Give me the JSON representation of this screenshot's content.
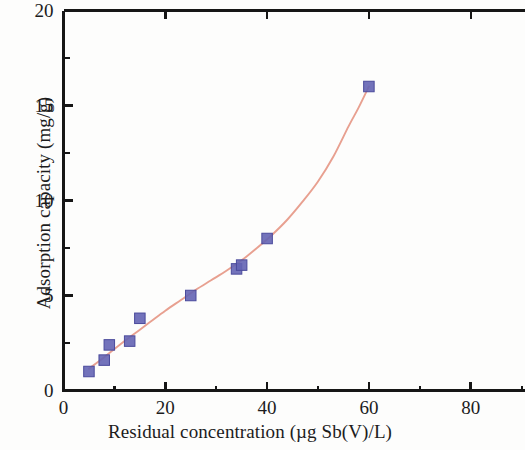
{
  "chart_data": {
    "type": "scatter",
    "title": "",
    "xlabel": "Residual concentration (µg Sb(V)/L)",
    "ylabel": "Adsorption capacity (mg/g)",
    "xlim": [
      0,
      90
    ],
    "ylim": [
      0,
      20
    ],
    "xticks": [
      0,
      20,
      40,
      60,
      80
    ],
    "xtick_labels": [
      "0",
      "20",
      "40",
      "60",
      "80"
    ],
    "x_minor_ticks": [
      10,
      30,
      50,
      70,
      90
    ],
    "yticks": [
      0,
      5,
      10,
      15,
      20
    ],
    "ytick_labels": [
      "0",
      "5",
      "10",
      "15",
      "20"
    ],
    "y_minor_ticks": [
      2.5,
      7.5,
      12.5,
      17.5
    ],
    "grid": false,
    "legend": false,
    "series": [
      {
        "name": "Adsorption isotherm data",
        "marker": "square",
        "marker_color": "#6464b4",
        "x": [
          5,
          8,
          9,
          13,
          15,
          25,
          34,
          35,
          40,
          60
        ],
        "y": [
          1.0,
          1.6,
          2.4,
          2.6,
          3.8,
          5.0,
          6.4,
          6.6,
          8.0,
          16.0
        ]
      },
      {
        "name": "Fitted isotherm curve",
        "type": "line",
        "line_color": "#e8a090",
        "x": [
          5,
          8,
          11,
          14,
          17,
          20,
          23,
          26,
          29,
          32,
          35,
          38,
          41,
          44,
          47,
          50,
          53,
          56,
          58,
          60
        ],
        "y": [
          1.15,
          1.75,
          2.4,
          3.0,
          3.6,
          4.2,
          4.75,
          5.3,
          5.8,
          6.3,
          6.85,
          7.5,
          8.2,
          9.0,
          9.95,
          11.0,
          12.3,
          13.9,
          14.9,
          16.0
        ]
      }
    ]
  },
  "axis": {
    "spine_color": "#161616",
    "background": "#fdfdfc"
  }
}
